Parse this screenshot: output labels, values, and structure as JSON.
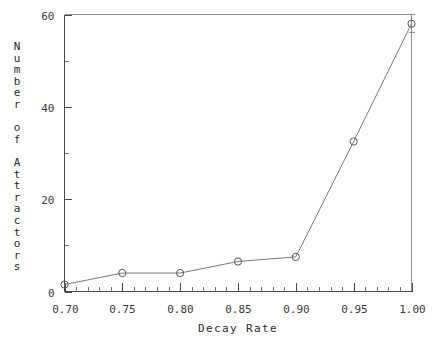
{
  "chart_data": {
    "type": "line",
    "title": "",
    "xlabel": "Decay Rate",
    "ylabel": "Number of Attractors",
    "x": [
      0.7,
      0.75,
      0.8,
      0.85,
      0.9,
      0.95,
      1.0
    ],
    "values": [
      1.5,
      4.0,
      4.0,
      6.5,
      7.5,
      32.5,
      58.0
    ],
    "series": [
      {
        "name": "Number of Attractors",
        "values": [
          1.5,
          4.0,
          4.0,
          6.5,
          7.5,
          32.5,
          58.0
        ]
      }
    ],
    "errors": [
      0,
      0,
      0,
      0,
      0,
      0,
      2.0
    ],
    "xlim": [
      0.7,
      1.0
    ],
    "ylim": [
      0,
      60
    ],
    "x_tick_labels": [
      "0.70",
      "0.75",
      "0.80",
      "0.85",
      "0.90",
      "0.95",
      "1.00"
    ],
    "x_tick_values": [
      0.7,
      0.75,
      0.8,
      0.85,
      0.9,
      0.95,
      1.0
    ],
    "x_minor_per_major": 5,
    "y_tick_labels": [
      "0",
      "20",
      "40",
      "60"
    ],
    "y_tick_values": [
      0,
      20,
      40,
      60
    ],
    "y_minor_per_major": 2,
    "marker": "open-circle",
    "grid": false,
    "legend": null,
    "legend_position": "none",
    "colors": {
      "line": "#7a7a7a",
      "marker": "#555555",
      "axis": "#4a4a4a",
      "frame": "#8f8f8f",
      "text": "#2b2b2b",
      "background": "#ffffff"
    }
  },
  "ylabel_chars": [
    "N",
    "u",
    "m",
    "b",
    "e",
    "r",
    "",
    "o",
    "f",
    "",
    "A",
    "t",
    "t",
    "r",
    "a",
    "c",
    "t",
    "o",
    "r",
    "s"
  ]
}
